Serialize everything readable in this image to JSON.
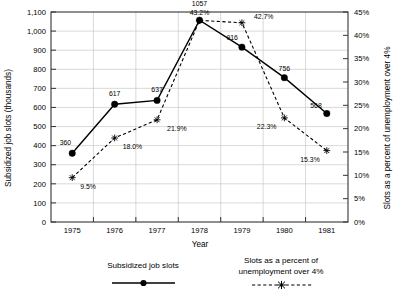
{
  "chart_data": {
    "type": "line",
    "title": "",
    "xlabel": "Year",
    "ylabel": "Subsidized job slots (thousands)",
    "y2label": "Slots as a percent of unemployment over 4%",
    "categories": [
      "1975",
      "1976",
      "1977",
      "1978",
      "1979",
      "1980",
      "1981"
    ],
    "x": [
      1975,
      1976,
      1977,
      1978,
      1979,
      1980,
      1981
    ],
    "ylim": [
      0,
      1100
    ],
    "y2lim": [
      0,
      45
    ],
    "yticks": [
      "0",
      "100",
      "200",
      "300",
      "400",
      "500",
      "600",
      "700",
      "800",
      "900",
      "1,000",
      "1,100"
    ],
    "ytick_values": [
      0,
      100,
      200,
      300,
      400,
      500,
      600,
      700,
      800,
      900,
      1000,
      1100
    ],
    "y2ticks": [
      "0%",
      "5%",
      "10%",
      "15%",
      "20%",
      "25%",
      "30%",
      "35%",
      "40%",
      "45%"
    ],
    "y2tick_values": [
      0,
      5,
      10,
      15,
      20,
      25,
      30,
      35,
      40,
      45
    ],
    "grid": true,
    "legend_position": "bottom",
    "series": [
      {
        "name": "Subsidized job slots",
        "axis": "left",
        "style": "solid",
        "marker": "filled-circle",
        "values": [
          360,
          617,
          637,
          1057,
          916,
          756,
          568
        ],
        "labels": [
          "360",
          "617",
          "637",
          "1057",
          "916",
          "756",
          "568"
        ]
      },
      {
        "name": "Slots as a percent of unemployment over 4%",
        "axis": "right",
        "style": "dashed",
        "marker": "star",
        "values": [
          9.5,
          18.0,
          21.9,
          43.2,
          42.7,
          22.3,
          15.3
        ],
        "labels": [
          "9.5%",
          "18.0%",
          "21.9%",
          "43.2%",
          "42.7%",
          "22.3%",
          "15.3%"
        ]
      }
    ]
  },
  "legend": {
    "entry_1_label": "Subsidized job slots",
    "entry_2_line_1": "Slots as a percent of",
    "entry_2_line_2": "unemployment over 4%"
  },
  "colors": {
    "series_1": "#000000",
    "series_2": "#000000",
    "grid": "#c9c9c9",
    "axis": "#333333",
    "background": "#ffffff"
  }
}
